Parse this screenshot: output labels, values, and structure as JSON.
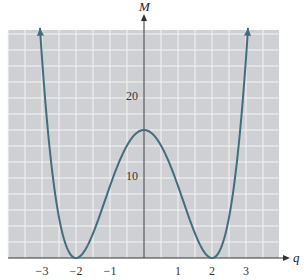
{
  "chart_data": {
    "type": "line",
    "title": "",
    "xlabel": "q",
    "ylabel": "M",
    "function": "M = (q^2 - 4)^2",
    "xlim": [
      -4.0,
      4.0
    ],
    "ylim": [
      0,
      28
    ],
    "grid": true,
    "x_ticks": [
      -3,
      -2,
      -1,
      1,
      2,
      3
    ],
    "x_tick_labels": [
      "−3",
      "−2",
      "−1",
      "1",
      "2",
      "3"
    ],
    "y_ticks": [
      10,
      20
    ],
    "y_tick_labels": [
      "10",
      "20"
    ],
    "series": [
      {
        "name": "M(q)",
        "color": "#3f6f7c",
        "arrows_at_ends": true,
        "x": [
          -3.06,
          -3.0,
          -2.75,
          -2.5,
          -2.25,
          -2.0,
          -1.75,
          -1.5,
          -1.25,
          -1.0,
          -0.75,
          -0.5,
          -0.25,
          0.0,
          0.25,
          0.5,
          0.75,
          1.0,
          1.25,
          1.5,
          1.75,
          2.0,
          2.25,
          2.5,
          2.75,
          3.0,
          3.06
        ],
        "y": [
          28.4,
          25.0,
          12.6,
          5.06,
          1.13,
          0.0,
          0.88,
          3.06,
          5.94,
          9.0,
          11.82,
          14.06,
          15.5,
          16.0,
          15.5,
          14.06,
          11.82,
          9.0,
          5.94,
          3.06,
          0.88,
          0.0,
          1.13,
          5.06,
          12.6,
          25.0,
          28.4
        ]
      }
    ],
    "key_points": [
      {
        "label": "local max",
        "q": 0,
        "M": 16
      },
      {
        "label": "min",
        "q": -2,
        "M": 0
      },
      {
        "label": "min",
        "q": 2,
        "M": 0
      }
    ]
  },
  "colors": {
    "plot_background": "#cfd0d4",
    "grid_lines": "#f4f4f4",
    "axis": "#333333",
    "curve": "#3f6f7c"
  }
}
